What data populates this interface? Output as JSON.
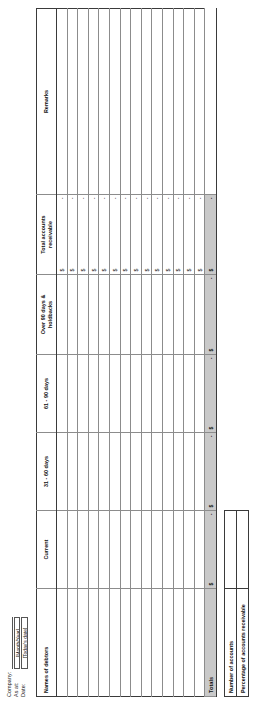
{
  "document": {
    "orientation": "landscape-rotated-90ccw"
  },
  "header": {
    "company": {
      "label": "Company:",
      "value": ""
    },
    "as_at": {
      "label": "As at:",
      "value": "[Month/Year]"
    },
    "date": {
      "label": "Date:",
      "value": "[Today's date]"
    }
  },
  "table": {
    "columns": [
      "Names of debtors",
      "Current",
      "31 - 60 days",
      "61 - 90 days",
      "Over 90 days &\nholdbacks",
      "Total accounts\nreceivable",
      "Remarks"
    ],
    "column_lines": [
      [
        "Names of debtors"
      ],
      [
        "Current"
      ],
      [
        "31 - 60 days"
      ],
      [
        "61 - 90 days"
      ],
      [
        "Over 90 days &",
        "holdbacks"
      ],
      [
        "Total accounts",
        "receivable"
      ],
      [
        "Remarks"
      ]
    ],
    "currency_symbol": "$",
    "empty_amount": "-",
    "row_count": 14,
    "rows": [
      {
        "name": "",
        "current": "",
        "d31_60": "",
        "d61_90": "",
        "over90": "",
        "total_cur": "$",
        "total_val": "-",
        "remarks": ""
      },
      {
        "name": "",
        "current": "",
        "d31_60": "",
        "d61_90": "",
        "over90": "",
        "total_cur": "$",
        "total_val": "-",
        "remarks": ""
      },
      {
        "name": "",
        "current": "",
        "d31_60": "",
        "d61_90": "",
        "over90": "",
        "total_cur": "$",
        "total_val": "-",
        "remarks": ""
      },
      {
        "name": "",
        "current": "",
        "d31_60": "",
        "d61_90": "",
        "over90": "",
        "total_cur": "$",
        "total_val": "-",
        "remarks": ""
      },
      {
        "name": "",
        "current": "",
        "d31_60": "",
        "d61_90": "",
        "over90": "",
        "total_cur": "$",
        "total_val": "-",
        "remarks": ""
      },
      {
        "name": "",
        "current": "",
        "d31_60": "",
        "d61_90": "",
        "over90": "",
        "total_cur": "$",
        "total_val": "-",
        "remarks": ""
      },
      {
        "name": "",
        "current": "",
        "d31_60": "",
        "d61_90": "",
        "over90": "",
        "total_cur": "$",
        "total_val": "-",
        "remarks": ""
      },
      {
        "name": "",
        "current": "",
        "d31_60": "",
        "d61_90": "",
        "over90": "",
        "total_cur": "$",
        "total_val": "-",
        "remarks": ""
      },
      {
        "name": "",
        "current": "",
        "d31_60": "",
        "d61_90": "",
        "over90": "",
        "total_cur": "$",
        "total_val": "-",
        "remarks": ""
      },
      {
        "name": "",
        "current": "",
        "d31_60": "",
        "d61_90": "",
        "over90": "",
        "total_cur": "$",
        "total_val": "-",
        "remarks": ""
      },
      {
        "name": "",
        "current": "",
        "d31_60": "",
        "d61_90": "",
        "over90": "",
        "total_cur": "$",
        "total_val": "-",
        "remarks": ""
      },
      {
        "name": "",
        "current": "",
        "d31_60": "",
        "d61_90": "",
        "over90": "",
        "total_cur": "$",
        "total_val": "-",
        "remarks": ""
      },
      {
        "name": "",
        "current": "",
        "d31_60": "",
        "d61_90": "",
        "over90": "",
        "total_cur": "$",
        "total_val": "-",
        "remarks": ""
      },
      {
        "name": "",
        "current": "",
        "d31_60": "",
        "d61_90": "",
        "over90": "",
        "total_cur": "$",
        "total_val": "-",
        "remarks": ""
      }
    ],
    "totals": {
      "label": "Totals",
      "current_cur": "$",
      "current_val": "-",
      "d31_60_cur": "$",
      "d31_60_val": "-",
      "d61_90_cur": "$",
      "d61_90_val": "-",
      "over90_cur": "$",
      "over90_val": "-",
      "total_cur": "$",
      "total_val": "-",
      "remarks": ""
    }
  },
  "summary": {
    "rows": [
      {
        "label": "Number of accounts",
        "value": ""
      },
      {
        "label": "Percentage of accounts receivable",
        "value": ""
      }
    ]
  }
}
